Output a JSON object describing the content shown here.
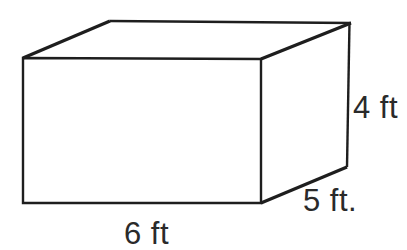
{
  "diagram": {
    "shape": "rectangular-prism",
    "labels": {
      "width": "6 ft",
      "depth": "5 ft.",
      "height": "4 ft"
    },
    "dimensions": {
      "width_ft": 6,
      "depth_ft": 5,
      "height_ft": 4
    },
    "colors": {
      "line": "#1e1e1e",
      "text": "#2a2a2a",
      "background": "#ffffff"
    }
  }
}
